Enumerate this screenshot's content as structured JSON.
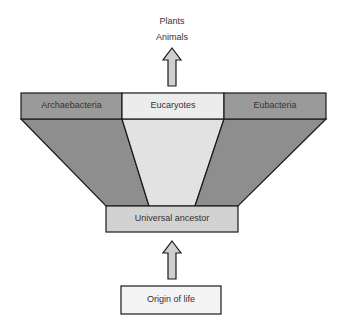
{
  "diagram": {
    "top_labels": {
      "line1": "Plants",
      "line2": "Animals"
    },
    "domains": {
      "left": "Archaebacteria",
      "center": "Eucaryotes",
      "right": "Eubacteria"
    },
    "ancestor": "Universal ancestor",
    "origin": "Origin of life",
    "arrows": [
      {
        "from": "Eucaryotes",
        "to": "Plants/Animals"
      },
      {
        "from": "Origin of life",
        "to": "Universal ancestor"
      }
    ],
    "colors": {
      "side_band": "#9a9a9a",
      "side_trapezoid": "#8e8e8e",
      "center_band": "#ececec",
      "center_trapezoid": "#e2e2e2",
      "ancestor_fill": "#d2d2d2",
      "origin_fill": "#f4f4f4",
      "arrow_fill": "#cfcfcf",
      "stroke": "#1a1a1a"
    }
  }
}
